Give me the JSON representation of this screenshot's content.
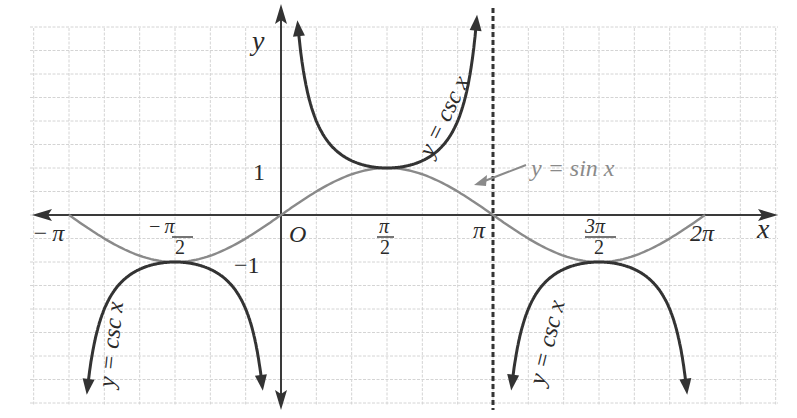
{
  "chart_data": {
    "type": "line",
    "title": "",
    "xlabel": "x",
    "ylabel": "y",
    "origin_label": "O",
    "xlim": [
      -3.1416,
      6.2832
    ],
    "ylim": [
      -3.9,
      4.0
    ],
    "grid": true,
    "x_ticks": [
      {
        "value": -3.1416,
        "label": "−π"
      },
      {
        "value": -1.5708,
        "label": "−π/2",
        "num": "−π",
        "den": "2"
      },
      {
        "value": 1.5708,
        "label": "π/2",
        "num": "π",
        "den": "2"
      },
      {
        "value": 3.1416,
        "label": "π"
      },
      {
        "value": 4.7124,
        "label": "3π/2",
        "num": "3π",
        "den": "2"
      },
      {
        "value": 6.2832,
        "label": "2π"
      }
    ],
    "y_ticks": [
      {
        "value": 1,
        "label": "1"
      },
      {
        "value": -1,
        "label": "−1"
      }
    ],
    "series": [
      {
        "name": "y = sin x",
        "color": "#8a8a8a",
        "domain": [
          -3.1416,
          6.2832
        ],
        "points": [
          [
            -3.1416,
            0
          ],
          [
            -1.5708,
            -1
          ],
          [
            0,
            0
          ],
          [
            1.5708,
            1
          ],
          [
            3.1416,
            0
          ],
          [
            4.7124,
            -1
          ],
          [
            6.2832,
            0
          ]
        ]
      },
      {
        "name": "y = csc x",
        "color": "#333333",
        "branches": [
          {
            "domain": [
              -3.0,
              -0.1
            ],
            "extremum": [
              -1.5708,
              -1
            ],
            "direction": "down"
          },
          {
            "domain": [
              0.13,
              3.0
            ],
            "extremum": [
              1.5708,
              1
            ],
            "direction": "up"
          },
          {
            "domain": [
              3.29,
              6.2
            ],
            "extremum": [
              4.7124,
              -1
            ],
            "direction": "down"
          }
        ]
      }
    ],
    "asymptotes": [
      {
        "x": 3.1416,
        "style": "dashed"
      }
    ],
    "annotations": [
      {
        "text": "y = csc x",
        "near": "upper branch (0, π)"
      },
      {
        "text": "y = csc x",
        "near": "lower branch (−π, 0)"
      },
      {
        "text": "y = csc x",
        "near": "lower branch (π, 2π)"
      },
      {
        "text": "y = sin x",
        "arrow_to": "sin curve near x ≈ 3π/4... π"
      }
    ]
  },
  "labels": {
    "y_axis": "y",
    "x_axis": "x",
    "origin": "O",
    "one": "1",
    "neg_one": "−1",
    "neg_pi": "−π",
    "neg_pi_half_num": "−π",
    "pi_half_num": "π",
    "half_den": "2",
    "pi": "π",
    "three_pi_half_num": "3π",
    "two_pi": "2π",
    "csc_label": "y = csc x",
    "sin_label": "y = sin x"
  }
}
